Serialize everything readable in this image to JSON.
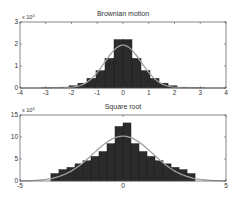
{
  "colors": {
    "background": "#ffffff",
    "bars": "#2b2b2b",
    "bar_edge": "#1a1a1a",
    "curve": "#a0a0a0",
    "axes": "#555555",
    "text": "#333333"
  },
  "chart_data": [
    {
      "type": "bar",
      "title": "Brownian motion",
      "xlabel": "",
      "ylabel": "",
      "y_multiplier": "x 10^4",
      "y_multiplier_base": "x 10",
      "y_multiplier_exp": "4",
      "xlim": [
        -4,
        4
      ],
      "ylim": [
        0,
        3
      ],
      "xticks": [
        -4,
        -3,
        -2,
        -1,
        0,
        1,
        2,
        3,
        4
      ],
      "yticks": [
        0,
        1,
        2,
        3
      ],
      "grid": false,
      "bin_width": 0.35,
      "bin_edges": [
        -2.8,
        -2.45,
        -2.1,
        -1.75,
        -1.4,
        -1.05,
        -0.7,
        -0.35,
        0,
        0.35,
        0.7,
        1.05,
        1.4,
        1.75,
        2.1,
        2.45,
        2.8
      ],
      "values": [
        0.01,
        0.02,
        0.04,
        0.1,
        0.22,
        0.44,
        0.79,
        1.35,
        2.2,
        2.2,
        1.35,
        0.79,
        0.44,
        0.22,
        0.1,
        0.04,
        0.02,
        0.01
      ],
      "bin_starts": [
        -3.15,
        -2.8,
        -2.45,
        -2.1,
        -1.75,
        -1.4,
        -1.05,
        -0.7,
        -0.35,
        0,
        0.35,
        0.7,
        1.05,
        1.4,
        1.75,
        2.1,
        2.45,
        2.8
      ],
      "fit_curve": {
        "type": "gaussian",
        "mean": 0,
        "sigma": 0.7,
        "peak": 1.95
      }
    },
    {
      "type": "bar",
      "title": "Square root",
      "xlabel": "",
      "ylabel": "",
      "y_multiplier": "x 10^4",
      "y_multiplier_base": "x 10",
      "y_multiplier_exp": "4",
      "xlim": [
        -5,
        5
      ],
      "ylim": [
        0,
        15
      ],
      "xticks": [
        -5,
        0,
        5
      ],
      "yticks": [
        0,
        5,
        10,
        15
      ],
      "grid": false,
      "bin_width": 0.389,
      "bin_starts": [
        -3.5,
        -3.111,
        -2.722,
        -2.333,
        -1.944,
        -1.556,
        -1.167,
        -0.778,
        -0.389,
        0,
        0.389,
        0.778,
        1.167,
        1.556,
        1.944,
        2.333,
        2.722,
        3.111
      ],
      "values": [
        1.7,
        2.6,
        3.1,
        3.9,
        4.6,
        5.6,
        6.7,
        8.5,
        12.4,
        13.2,
        8.5,
        6.7,
        5.6,
        4.6,
        3.9,
        3.1,
        2.6,
        1.7
      ],
      "fit_curve": {
        "type": "gaussian",
        "mean": 0,
        "sigma": 1.45,
        "peak": 10.2
      }
    }
  ],
  "panels": [
    {
      "title": "Brownian motion",
      "multiplier_base": "x 10",
      "multiplier_exp": "4"
    },
    {
      "title": "Square root",
      "multiplier_base": "x 10",
      "multiplier_exp": "4"
    }
  ]
}
